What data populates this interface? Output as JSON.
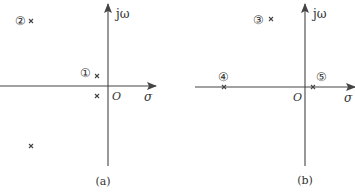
{
  "panels": [
    {
      "id": "a",
      "caption": "(a)",
      "axes": {
        "imag_label": "jω",
        "real_label": "σ",
        "origin_label": "O"
      },
      "poles": [
        {
          "label": "①",
          "position": "near origin, upper half-plane (small positive imaginary)"
        },
        {
          "label": "",
          "position": "conjugate of ①, lower half-plane"
        },
        {
          "label": "②",
          "position": "far left, upper half-plane (large imaginary)"
        },
        {
          "label": "",
          "position": "conjugate of ②, lower half-plane"
        }
      ]
    },
    {
      "id": "b",
      "caption": "(b)",
      "axes": {
        "imag_label": "jω",
        "real_label": "σ",
        "origin_label": "O"
      },
      "poles": [
        {
          "label": "③",
          "position": "upper half-plane, left of jω axis"
        },
        {
          "label": "④",
          "position": "on negative real axis, far left"
        },
        {
          "label": "⑤",
          "position": "on positive real axis, near origin"
        }
      ]
    }
  ],
  "colors": {
    "ink": "#444444",
    "background": "#ffffff"
  }
}
